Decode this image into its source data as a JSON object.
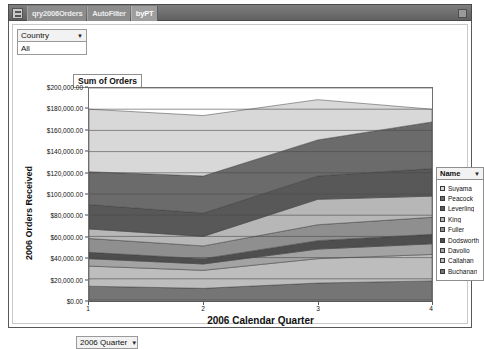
{
  "window": {
    "tabs": [
      {
        "label": "qry2006Orders",
        "active": false
      },
      {
        "label": "AutoFilter",
        "active": false
      },
      {
        "label": "byPT",
        "active": true
      }
    ],
    "sysmenu_icon": "window-menu-icon",
    "close_icon": "window-close-icon"
  },
  "filters": {
    "country": {
      "field_label": "Country",
      "value": "All",
      "caret": "▼"
    },
    "quarter": {
      "field_label": "2006 Quarter",
      "caret": "▼"
    }
  },
  "chart_title_tag": "Sum of Orders",
  "legend": {
    "header": "Name",
    "caret": "▼",
    "items": [
      {
        "label": "Suyama",
        "color": "#d8d8d8"
      },
      {
        "label": "Peacock",
        "color": "#6b6b6b"
      },
      {
        "label": "Leverling",
        "color": "#585858"
      },
      {
        "label": "King",
        "color": "#b7b7b7"
      },
      {
        "label": "Fuller",
        "color": "#8f8f8f"
      },
      {
        "label": "Dodsworth",
        "color": "#4e4e4e"
      },
      {
        "label": "Davolio",
        "color": "#a3a3a3"
      },
      {
        "label": "Callahan",
        "color": "#bdbdbd"
      },
      {
        "label": "Buchanan",
        "color": "#757575"
      }
    ]
  },
  "chart_data": {
    "type": "area",
    "stacked": true,
    "title": "Sum of Orders",
    "xlabel": "2006 Calendar Quarter",
    "ylabel": "2006 Orders Received",
    "categories": [
      "1",
      "2",
      "3",
      "4"
    ],
    "x": [
      1,
      2,
      3,
      4
    ],
    "ylim": [
      0,
      200000
    ],
    "ytick_step": 20000,
    "ytick_labels": [
      "$200,000.00",
      "$180,000.00",
      "$160,000.00",
      "$140,000.00",
      "$120,000.00",
      "$100,000.00",
      "$80,000.00",
      "$60,000.00",
      "$40,000.00",
      "$20,000.00",
      "$0.00"
    ],
    "ytick_values": [
      200000,
      180000,
      160000,
      140000,
      120000,
      100000,
      80000,
      60000,
      40000,
      20000,
      0
    ],
    "grid": true,
    "grid_axis": "y",
    "legend_position": "right",
    "legend_title": "Name",
    "series": [
      {
        "name": "Buchanan",
        "color": "#757575",
        "values": [
          13000,
          11000,
          16000,
          18000
        ]
      },
      {
        "name": "Callahan",
        "color": "#bdbdbd",
        "values": [
          19000,
          17000,
          23000,
          25000
        ]
      },
      {
        "name": "Davolio",
        "color": "#a3a3a3",
        "values": [
          7000,
          6000,
          9000,
          10000
        ]
      },
      {
        "name": "Dodsworth",
        "color": "#4e4e4e",
        "values": [
          6000,
          5000,
          8000,
          9000
        ]
      },
      {
        "name": "Fuller",
        "color": "#8f8f8f",
        "values": [
          13000,
          12000,
          15000,
          16000
        ]
      },
      {
        "name": "King",
        "color": "#b7b7b7",
        "values": [
          9000,
          9000,
          24000,
          20000
        ]
      },
      {
        "name": "Leverling",
        "color": "#585858",
        "values": [
          23000,
          22000,
          22000,
          26000
        ]
      },
      {
        "name": "Peacock",
        "color": "#6b6b6b",
        "values": [
          31000,
          35000,
          34000,
          44000
        ]
      },
      {
        "name": "Suyama",
        "color": "#d8d8d8",
        "values": [
          59000,
          57000,
          38000,
          12000
        ]
      }
    ],
    "series_totals": [
      180000,
      174000,
      189000,
      180000
    ]
  }
}
